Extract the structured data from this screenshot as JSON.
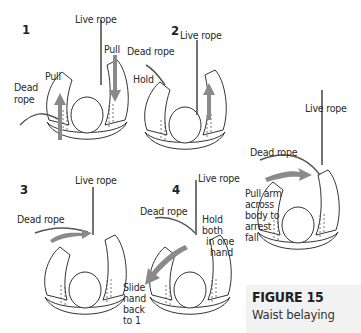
{
  "figure": {
    "title": "FIGURE 15",
    "subtitle": "Waist belaying"
  },
  "panels": [
    {
      "number": "1",
      "labels": {
        "live": "Live rope",
        "pull_right": "Pull",
        "pull_left": "Pull",
        "dead_1": "Dead",
        "dead_2": "rope"
      }
    },
    {
      "number": "2",
      "labels": {
        "live": "Live rope",
        "dead": "Dead rope",
        "hold": "Hold"
      }
    },
    {
      "number": "3",
      "labels": {
        "live": "Live rope",
        "dead": "Dead rope"
      }
    },
    {
      "number": "4",
      "labels": {
        "live": "Live rope",
        "dead": "Dead rope",
        "hold_1": "Hold",
        "hold_2": "both",
        "hold_3": "in one",
        "hold_4": "hand",
        "slide_1": "Slide",
        "slide_2": "hand",
        "slide_3": "back",
        "slide_4": "to 1"
      }
    },
    {
      "number": "",
      "labels": {
        "live": "Live rope",
        "dead": "Dead rope",
        "arrest_1": "Pull arm",
        "arrest_2": "across",
        "arrest_3": "body to",
        "arrest_4": "arrest",
        "arrest_5": "fall"
      }
    }
  ],
  "colors": {
    "arrow": "#8a8a8a",
    "line": "#333333",
    "caption_bg": "#f2f2f2"
  }
}
